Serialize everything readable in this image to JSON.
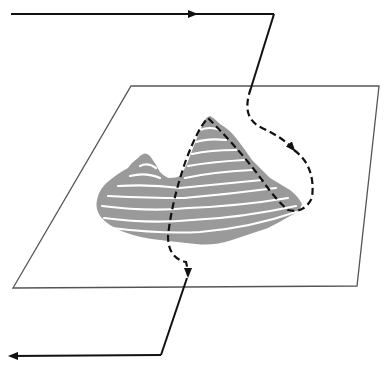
{
  "diagram": {
    "type": "path-over-terrain-illustration",
    "elements": {
      "plane": {
        "shape": "parallelogram",
        "stroke": "#555555"
      },
      "terrain": {
        "shape": "contour-mountain",
        "fill": "#9a9a9a",
        "contour_color": "#ffffff",
        "peaks": 2
      },
      "path_in": {
        "style": "solid",
        "color": "#111111",
        "arrow": "right"
      },
      "path_over_terrain": {
        "style": "dashed",
        "color": "#111111",
        "arrows": [
          "down-right",
          "down"
        ]
      },
      "path_out": {
        "style": "solid",
        "color": "#111111",
        "arrow": "left"
      }
    },
    "colors": {
      "background": "#ffffff",
      "line": "#111111",
      "plane_edge": "#555555",
      "terrain": "#9a9a9a"
    }
  }
}
